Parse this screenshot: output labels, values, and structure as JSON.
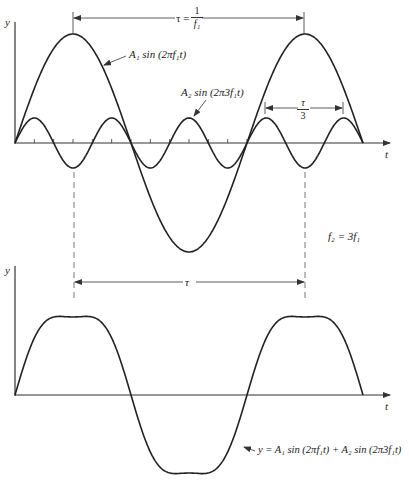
{
  "top_plot": {
    "y_label": "y",
    "t_label": "t",
    "period_label": "τ =",
    "period_frac_num": "1",
    "period_frac_den": "f₁",
    "third_period_num": "τ",
    "third_period_den": "3",
    "curve1_label": "A₁ sin (2πf₁t)",
    "curve2_label": "A₂ sin (2π3f₁t)",
    "origin": [
      15,
      143
    ],
    "period_px": 232,
    "A1_px": 109,
    "A2_px": 25,
    "t_end_px": 363
  },
  "relation_label": "f₂ = 3f₁",
  "bottom_plot": {
    "y_label": "y",
    "t_label": "t",
    "period_label": "τ",
    "sum_label": "y = A₁ sin (2πf₁t) + A₂ sin (2π3f₁t)",
    "origin": [
      15,
      395
    ],
    "period_px": 232,
    "A1_px": 90,
    "A2_px": 12,
    "t_end_px": 363
  },
  "stroke_color": "#222222"
}
